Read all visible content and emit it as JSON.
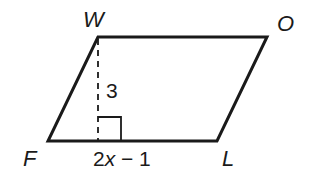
{
  "figure": {
    "type": "parallelogram",
    "vertices": [
      {
        "name": "W",
        "x": 98,
        "y": 37,
        "label_x": 83,
        "label_y": 27
      },
      {
        "name": "O",
        "x": 267,
        "y": 37,
        "label_x": 277,
        "label_y": 31
      },
      {
        "name": "L",
        "x": 217,
        "y": 141,
        "label_x": 222,
        "label_y": 166
      },
      {
        "name": "F",
        "x": 48,
        "y": 141,
        "label_x": 23,
        "label_y": 166
      }
    ],
    "height": {
      "label": "3",
      "from": {
        "x": 98,
        "y": 37
      },
      "to": {
        "x": 98,
        "y": 141
      },
      "style": "dashed"
    },
    "base": {
      "label_prefix": "2",
      "label_var": "x",
      "label_suffix": " − 1",
      "label_full": "2x − 1"
    },
    "right_angle_marker": {
      "x": 98,
      "y": 117,
      "size": 23
    },
    "colors": {
      "stroke": "#1a1a1a",
      "background": "#ffffff"
    }
  }
}
